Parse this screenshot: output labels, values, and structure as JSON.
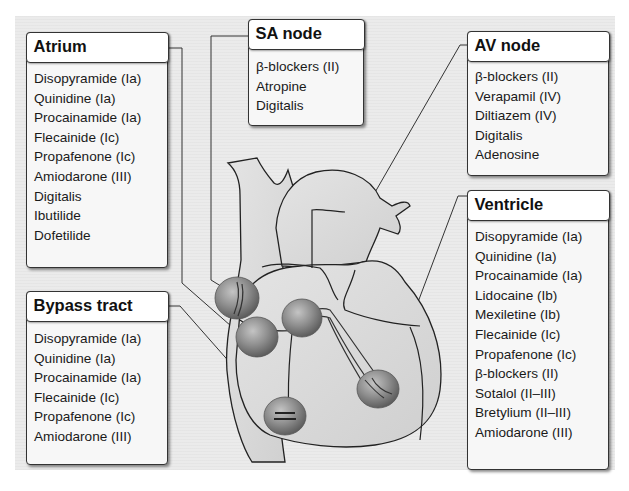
{
  "figure": {
    "colors": {
      "background_panel": "#ebebeb",
      "box_fill": "#f7f7f7",
      "box_border": "#333333",
      "heart_fill": "#d9d9d9",
      "node_fill": "#8f8f8f"
    }
  },
  "boxes": {
    "atrium": {
      "title": "Atrium",
      "items": [
        "Disopyramide (Ia)",
        "Quinidine (Ia)",
        "Procainamide (Ia)",
        "Flecainide (Ic)",
        "Propafenone (Ic)",
        "Amiodarone (III)",
        "Digitalis",
        "Ibutilide",
        "Dofetilide"
      ]
    },
    "sa_node": {
      "title": "SA node",
      "items": [
        "β-blockers (II)",
        "Atropine",
        "Digitalis"
      ]
    },
    "av_node": {
      "title": "AV node",
      "items": [
        "β-blockers (II)",
        "Verapamil (IV)",
        "Diltiazem (IV)",
        "Digitalis",
        "Adenosine"
      ]
    },
    "ventricle": {
      "title": "Ventricle",
      "items": [
        "Disopyramide (Ia)",
        "Quinidine (Ia)",
        "Procainamide (Ia)",
        "Lidocaine (Ib)",
        "Mexiletine (Ib)",
        "Flecainide (Ic)",
        "Propafenone (Ic)",
        "β-blockers (II)",
        "Sotalol (II–III)",
        "Bretylium (II–III)",
        "Amiodarone (III)"
      ]
    },
    "bypass_tract": {
      "title": "Bypass tract",
      "items": [
        "Disopyramide (Ia)",
        "Quinidine (Ia)",
        "Procainamide (Ia)",
        "Flecainide (Ic)",
        "Propafenone (Ic)",
        "Amiodarone (III)"
      ]
    }
  }
}
